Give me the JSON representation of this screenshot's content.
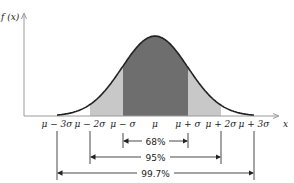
{
  "chart_data": {
    "type": "area",
    "title": "",
    "ylabel": "f(x)",
    "xlabel": "x",
    "distribution": "normal",
    "ticks": [
      "μ − 3σ",
      "μ − 2σ",
      "μ − σ",
      "μ",
      "μ + σ",
      "μ + 2σ",
      "μ + 3σ"
    ],
    "tick_sigma": [
      -3,
      -2,
      -1,
      0,
      1,
      2,
      3
    ],
    "regions": [
      {
        "label": "68%",
        "from_sigma": -1,
        "to_sigma": 1,
        "shade": "#6e6e6e"
      },
      {
        "label": "95%",
        "from_sigma": -2,
        "to_sigma": 2,
        "shade": "#c8c8c8"
      },
      {
        "label": "99.7%",
        "from_sigma": -3,
        "to_sigma": 3,
        "shade": "#ffffff"
      }
    ],
    "grid": false,
    "legend": "none"
  },
  "colors": {
    "inner": "#6e6e6e",
    "middle": "#c8c8c8",
    "curve": "#222222",
    "axis": "#999999"
  },
  "axes": {
    "y_label": "f (x)",
    "x_label": "x"
  },
  "ticks": {
    "m3": "μ − 3σ",
    "m2": "μ − 2σ",
    "m1": "μ − σ",
    "mu": "μ",
    "p1": "μ + σ",
    "p2": "μ + 2σ",
    "p3": "μ + 3σ"
  },
  "ranges": {
    "r68": "68%",
    "r95": "95%",
    "r997": "99.7%"
  }
}
